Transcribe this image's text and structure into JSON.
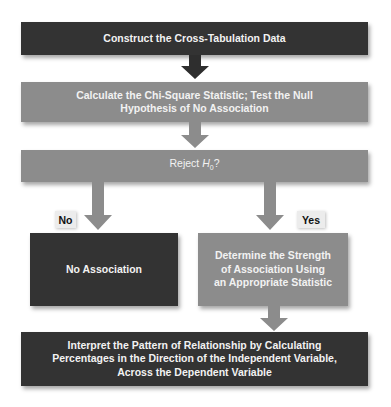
{
  "flowchart": {
    "step1": "Construct the Cross-Tabulation Data",
    "step2_line1": "Calculate the Chi-Square Statistic; Test the Null",
    "step2_line2": "Hypothesis of No Association",
    "decision_prefix": "Reject ",
    "decision_var": "H",
    "decision_sub": "0",
    "decision_suffix": "?",
    "branch_no_label": "No",
    "branch_yes_label": "Yes",
    "no_outcome": "No Association",
    "yes_line1": "Determine the Strength",
    "yes_line2": "of Association Using",
    "yes_line3": "an Appropriate Statistic",
    "final_line1": "Interpret the Pattern of Relationship by Calculating",
    "final_line2": "Percentages in the Direction of the Independent Variable,",
    "final_line3": "Across the Dependent Variable"
  },
  "colors": {
    "dark_box": "#333333",
    "gray_box": "#8c8c8c",
    "label_bg": "#ececec"
  }
}
